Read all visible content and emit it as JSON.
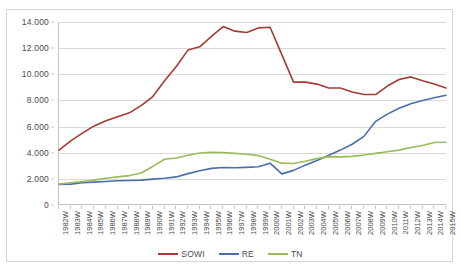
{
  "chart_data": {
    "type": "line",
    "title": "",
    "subtitle": "",
    "xlabel": "",
    "ylabel": "",
    "ylim": [
      0,
      14000
    ],
    "ytick_step": 2000,
    "ytick_labels": [
      "14.000",
      "12.000",
      "10.000",
      "8.000",
      "6.000",
      "4.000",
      "2.000",
      "0"
    ],
    "ytick_values": [
      14000,
      12000,
      10000,
      8000,
      6000,
      4000,
      2000,
      0
    ],
    "grid": true,
    "legend_position": "bottom",
    "categories": [
      "1982W",
      "1983W",
      "1984W",
      "1985W",
      "1986W",
      "1987W",
      "1988W",
      "1989W",
      "1990W",
      "1991W",
      "1992W",
      "1993W",
      "1994W",
      "1995W",
      "1996W",
      "1997W",
      "1998W",
      "1999W",
      "2000W",
      "2001W",
      "2002W",
      "2003W",
      "2004W",
      "2005W",
      "2006W",
      "2007W",
      "2008W",
      "2009W",
      "2010W",
      "2011W",
      "2012W",
      "2013W",
      "2014W",
      "2015W"
    ],
    "series": [
      {
        "name": "SOWI",
        "color": "#a33b32",
        "values": [
          4200,
          4900,
          5500,
          6050,
          6450,
          6750,
          7050,
          7600,
          8300,
          9500,
          10600,
          11850,
          12100,
          12900,
          13650,
          13300,
          13200,
          13550,
          13600,
          11500,
          9400,
          9400,
          9250,
          8950,
          8950,
          8650,
          8450,
          8450,
          9100,
          9600,
          9800,
          9500,
          9250,
          8950
        ]
      },
      {
        "name": "RE",
        "color": "#4a6eab",
        "values": [
          1580,
          1600,
          1700,
          1750,
          1800,
          1850,
          1870,
          1900,
          1980,
          2050,
          2150,
          2400,
          2620,
          2800,
          2870,
          2850,
          2880,
          2930,
          3200,
          2380,
          2650,
          3050,
          3400,
          3800,
          4200,
          4650,
          5250,
          6400,
          6950,
          7400,
          7750,
          8000,
          8200,
          8400
        ]
      },
      {
        "name": "TN",
        "color": "#9bbb59",
        "values": [
          1600,
          1700,
          1800,
          1900,
          2050,
          2150,
          2250,
          2450,
          2950,
          3500,
          3600,
          3800,
          3980,
          4030,
          4020,
          3950,
          3880,
          3780,
          3500,
          3200,
          3180,
          3350,
          3550,
          3700,
          3680,
          3720,
          3820,
          3950,
          4080,
          4200,
          4400,
          4550,
          4780,
          4800
        ]
      }
    ]
  },
  "legend": {
    "items": [
      {
        "label": "SOWI",
        "color": "#a33b32"
      },
      {
        "label": "RE",
        "color": "#4a6eab"
      },
      {
        "label": "TN",
        "color": "#9bbb59"
      }
    ]
  },
  "colors": {
    "sowi": "#a33b32",
    "re": "#4a6eab",
    "tn": "#9bbb59",
    "gridline": "#d9d9d9",
    "axis": "#c3c3c3",
    "text": "#4a4a4a",
    "frame": "#d4d4d4",
    "background": "#ffffff"
  }
}
